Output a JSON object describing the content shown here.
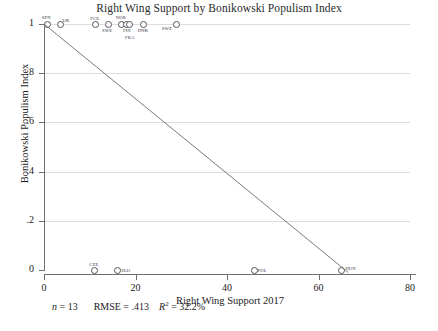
{
  "chart_data": {
    "type": "scatter",
    "title": "Right Wing Support by Bonikowski Populism Index",
    "xlabel": "Right Wing Support 2017",
    "ylabel": "Bonikowski Populism Index",
    "xlim": [
      0,
      80
    ],
    "ylim": [
      0,
      1
    ],
    "xticks": [
      "0",
      "20",
      "40",
      "60",
      "80"
    ],
    "xtick_values": [
      0,
      20,
      40,
      60,
      80
    ],
    "yticks": [
      "0",
      ".2",
      ".4",
      ".6",
      ".8",
      "1"
    ],
    "ytick_values": [
      0,
      0.2,
      0.4,
      0.6,
      0.8,
      1
    ],
    "grid": "horizontal",
    "legend": "none",
    "marker": "open-circle",
    "points": [
      {
        "label": "SPN",
        "x": 0.6,
        "y": 1,
        "lx": -5,
        "ly": -9
      },
      {
        "label": "UK",
        "x": 3.4,
        "y": 1,
        "lx": 3,
        "ly": -6
      },
      {
        "label": "FCE",
        "x": 11.2,
        "y": 1,
        "lx": -5,
        "ly": -8
      },
      {
        "label": "SWE",
        "x": 14.0,
        "y": 1,
        "lx": -6,
        "ly": 4
      },
      {
        "label": "NOR",
        "x": 16.8,
        "y": 1,
        "lx": -5,
        "ly": -9
      },
      {
        "label": "FIN",
        "x": 17.9,
        "y": 1,
        "lx": -3,
        "ly": 4
      },
      {
        "label": "FRA",
        "x": 18.6,
        "y": 1,
        "lx": -4,
        "ly": 11
      },
      {
        "label": "DNK",
        "x": 21.6,
        "y": 1,
        "lx": -5,
        "ly": 4
      },
      {
        "label": "SWZ",
        "x": 28.8,
        "y": 1,
        "lx": -14,
        "ly": 2
      },
      {
        "label": "CZE",
        "x": 11.0,
        "y": 0,
        "lx": -5,
        "ly": -8
      },
      {
        "label": "SLO",
        "x": 16.0,
        "y": 0,
        "lx": 4,
        "ly": -2
      },
      {
        "label": "POL",
        "x": 45.8,
        "y": 0,
        "lx": 4,
        "ly": -2
      },
      {
        "label": "HUN",
        "x": 65.0,
        "y": 0,
        "lx": 4,
        "ly": -4
      }
    ],
    "fit_line": {
      "x0": 0,
      "y0": 1.0,
      "x1": 66.5,
      "y1": -0.01
    },
    "annotations": {
      "n_label": "n",
      "n_value": "= 13",
      "rmse_label": "RMSE =",
      "rmse_value": ".413",
      "r2_label": "R",
      "r2_sup": "2",
      "r2_value": "= 32.2%"
    }
  }
}
